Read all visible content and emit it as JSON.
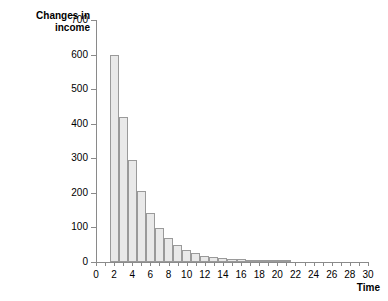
{
  "chart_data": {
    "type": "bar",
    "title": "",
    "ylabel": "Changes in\nincome",
    "xlabel": "Time",
    "xlim": [
      0,
      30
    ],
    "ylim": [
      0,
      700
    ],
    "ytick_values": [
      0,
      100,
      200,
      300,
      400,
      500,
      600,
      700
    ],
    "ytick_labels": [
      "0",
      "100",
      "200",
      "300",
      "400",
      "500",
      "600",
      "700"
    ],
    "xtick_values": [
      0,
      1,
      2,
      3,
      4,
      5,
      6,
      7,
      8,
      9,
      10,
      11,
      12,
      13,
      14,
      15,
      16,
      17,
      18,
      19,
      20,
      21,
      22,
      23,
      24,
      25,
      26,
      27,
      28,
      29,
      30
    ],
    "xtick_labeled": [
      0,
      2,
      4,
      6,
      8,
      10,
      12,
      14,
      16,
      18,
      20,
      22,
      24,
      26,
      28,
      30
    ],
    "xtick_labels": [
      "0",
      "2",
      "4",
      "6",
      "8",
      "10",
      "12",
      "14",
      "16",
      "18",
      "20",
      "22",
      "24",
      "26",
      "28",
      "30"
    ],
    "grid": false,
    "legend": null,
    "bar_fill_color": "#e9e9e9",
    "bar_edge_color": "#9a9a9a",
    "axis_color": "#8a8a8a",
    "categories": [
      2,
      3,
      4,
      5,
      6,
      7,
      8,
      9,
      10,
      11,
      12,
      13,
      14,
      15,
      16,
      17,
      18,
      19,
      20,
      21
    ],
    "values": [
      600,
      420,
      295,
      205,
      143,
      97,
      70,
      50,
      35,
      25,
      18,
      14,
      11,
      9,
      8,
      7,
      6,
      5,
      4,
      3
    ]
  }
}
